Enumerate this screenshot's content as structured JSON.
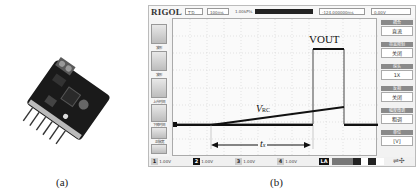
{
  "panel_a": {
    "caption": "(a)",
    "image_description": "Sensor/timer circuit board module with screw terminal and pin header"
  },
  "panel_b": {
    "caption": "(b)",
    "scope": {
      "brand": "RIGOL",
      "top": {
        "trigger_status": "T'D",
        "timebase_box": "100ms",
        "memory_info_1": "1.00kPts",
        "memory_info_2": "1.00kPts",
        "offset": "-124.000000ms",
        "trigger_level": "0.00V"
      },
      "left_buttons": [
        {
          "label": "波形"
        },
        {
          "label": "波形"
        },
        {
          "label": "上升时间"
        },
        {
          "label": "下降时间"
        },
        {
          "label": "正脉宽"
        },
        {
          "label": "负脉宽"
        }
      ],
      "right_menu": [
        {
          "header": "耦合",
          "value": "直流"
        },
        {
          "header": "带宽限制",
          "value": "关闭"
        },
        {
          "header": "探头",
          "value": "1X"
        },
        {
          "header": "反相",
          "value": "关闭"
        },
        {
          "header": "幅度微调",
          "value": "粗调"
        },
        {
          "header": "单位",
          "value": "[V]"
        }
      ],
      "channels": [
        {
          "num": "1",
          "scale": "1.00V"
        },
        {
          "num": "2",
          "scale": "1.00V"
        },
        {
          "num": "3",
          "scale": "1.00V"
        },
        {
          "num": "4",
          "scale": "1.00V"
        }
      ],
      "la_label": "LA",
      "annotations": {
        "vout": "VOUT",
        "vrc_main": "V",
        "vrc_sub": "RC",
        "tx_main": "t",
        "tx_sub": "x"
      }
    }
  }
}
